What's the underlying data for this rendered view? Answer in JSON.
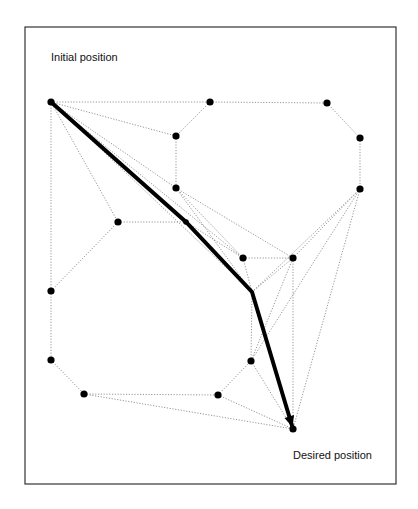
{
  "diagram": {
    "type": "visibility-graph-path-planning",
    "labels": {
      "start": "Initial position",
      "goal": "Desired position"
    },
    "frame": {
      "x": 25,
      "y": 27,
      "width": 371,
      "height": 457
    },
    "nodes": [
      {
        "id": "S",
        "x": 51,
        "y": 102,
        "role": "start"
      },
      {
        "id": "A",
        "x": 210,
        "y": 102
      },
      {
        "id": "B",
        "x": 327,
        "y": 103
      },
      {
        "id": "C",
        "x": 360,
        "y": 138
      },
      {
        "id": "D",
        "x": 360,
        "y": 189
      },
      {
        "id": "E",
        "x": 176,
        "y": 136
      },
      {
        "id": "F",
        "x": 176,
        "y": 188
      },
      {
        "id": "G",
        "x": 118,
        "y": 222
      },
      {
        "id": "H",
        "x": 186,
        "y": 222
      },
      {
        "id": "I",
        "x": 243,
        "y": 258
      },
      {
        "id": "J",
        "x": 293,
        "y": 258
      },
      {
        "id": "K",
        "x": 252,
        "y": 292,
        "dot": false
      },
      {
        "id": "L",
        "x": 51,
        "y": 291
      },
      {
        "id": "M",
        "x": 51,
        "y": 360
      },
      {
        "id": "N",
        "x": 84,
        "y": 394
      },
      {
        "id": "O",
        "x": 218,
        "y": 395
      },
      {
        "id": "P",
        "x": 251,
        "y": 361
      },
      {
        "id": "T",
        "x": 293,
        "y": 429,
        "role": "goal"
      }
    ],
    "edges": [
      [
        "S",
        "A"
      ],
      [
        "A",
        "B"
      ],
      [
        "B",
        "C"
      ],
      [
        "C",
        "D"
      ],
      [
        "A",
        "E"
      ],
      [
        "E",
        "F"
      ],
      [
        "S",
        "E"
      ],
      [
        "S",
        "F"
      ],
      [
        "S",
        "G"
      ],
      [
        "S",
        "L"
      ],
      [
        "S",
        "I"
      ],
      [
        "S",
        "K"
      ],
      [
        "F",
        "I"
      ],
      [
        "F",
        "K"
      ],
      [
        "G",
        "L"
      ],
      [
        "G",
        "H"
      ],
      [
        "H",
        "I"
      ],
      [
        "I",
        "J"
      ],
      [
        "I",
        "K"
      ],
      [
        "L",
        "M"
      ],
      [
        "M",
        "N"
      ],
      [
        "N",
        "O"
      ],
      [
        "O",
        "P"
      ],
      [
        "N",
        "T"
      ],
      [
        "O",
        "T"
      ],
      [
        "P",
        "T"
      ],
      [
        "P",
        "K"
      ],
      [
        "P",
        "J"
      ],
      [
        "K",
        "J"
      ],
      [
        "J",
        "T"
      ],
      [
        "J",
        "D"
      ],
      [
        "K",
        "D"
      ],
      [
        "D",
        "T"
      ],
      [
        "D",
        "P"
      ],
      [
        "F",
        "J"
      ]
    ],
    "path": [
      "S",
      "H",
      "K",
      "T"
    ],
    "style": {
      "node_color": "#000000",
      "edge_color": "#8a8a8a",
      "path_color": "#000000",
      "frame_color": "#333333"
    }
  }
}
